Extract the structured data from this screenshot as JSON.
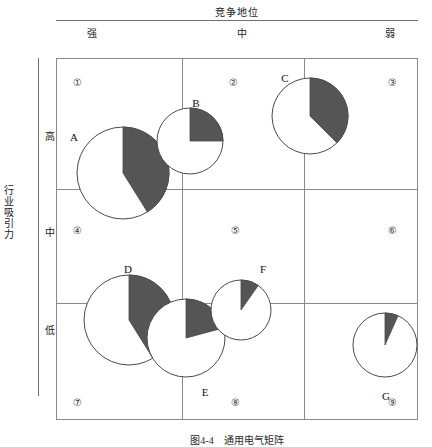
{
  "figure": {
    "column_axis_title": "竞争地位",
    "row_axis_title": "行业吸引力",
    "column_headers": [
      "强",
      "中",
      "弱"
    ],
    "row_headers": [
      "高",
      "中",
      "低"
    ],
    "cell_numbers": [
      "①",
      "②",
      "③",
      "④",
      "⑤",
      "⑥",
      "⑦",
      "⑧",
      "⑨"
    ],
    "caption": "图4-4　通用电气矩阵",
    "shade_color": "#555555",
    "outline_color": "#4a4a4a",
    "grid_color": "#8a8a8a"
  },
  "chart_data": {
    "type": "pie",
    "xlabel": "竞争地位",
    "ylabel": "行业吸引力",
    "x_categories": [
      "强",
      "中",
      "弱"
    ],
    "y_categories": [
      "高",
      "中",
      "低"
    ],
    "grid": true,
    "legend": "none",
    "note": "每个圆代表一个业务单元；圆面积表示市场规模，阴影扇区表示该业务的市场份额",
    "cells": [
      {
        "number": "①",
        "column": "强",
        "row": "高"
      },
      {
        "number": "②",
        "column": "中",
        "row": "高"
      },
      {
        "number": "③",
        "column": "弱",
        "row": "高"
      },
      {
        "number": "④",
        "column": "强",
        "row": "中"
      },
      {
        "number": "⑤",
        "column": "中",
        "row": "中"
      },
      {
        "number": "⑥",
        "column": "弱",
        "row": "中"
      },
      {
        "number": "⑦",
        "column": "强",
        "row": "低"
      },
      {
        "number": "⑧",
        "column": "中",
        "row": "低"
      },
      {
        "number": "⑨",
        "column": "弱",
        "row": "低"
      }
    ],
    "series": [
      {
        "name": "A",
        "cx": 123,
        "cy": 173,
        "r": 46,
        "share_deg": 148,
        "share_pct": 41,
        "label_x": 74,
        "label_y": 137
      },
      {
        "name": "B",
        "cx": 190,
        "cy": 141,
        "r": 33,
        "share_deg": 90,
        "share_pct": 25,
        "label_x": 196,
        "label_y": 103
      },
      {
        "name": "C",
        "cx": 310,
        "cy": 116,
        "r": 38,
        "share_deg": 135,
        "share_pct": 38,
        "label_x": 285,
        "label_y": 78
      },
      {
        "name": "D",
        "cx": 129,
        "cy": 320,
        "r": 45,
        "share_deg": 148,
        "share_pct": 41,
        "label_x": 128,
        "label_y": 269
      },
      {
        "name": "E",
        "cx": 186,
        "cy": 338,
        "r": 39,
        "share_deg": 75,
        "share_pct": 21,
        "label_x": 205,
        "label_y": 392
      },
      {
        "name": "F",
        "cx": 241,
        "cy": 310,
        "r": 30,
        "share_deg": 35,
        "share_pct": 10,
        "label_x": 263,
        "label_y": 269
      },
      {
        "name": "G",
        "cx": 385,
        "cy": 345,
        "r": 32,
        "share_deg": 24,
        "share_pct": 7,
        "label_x": 386,
        "label_y": 396
      }
    ]
  }
}
